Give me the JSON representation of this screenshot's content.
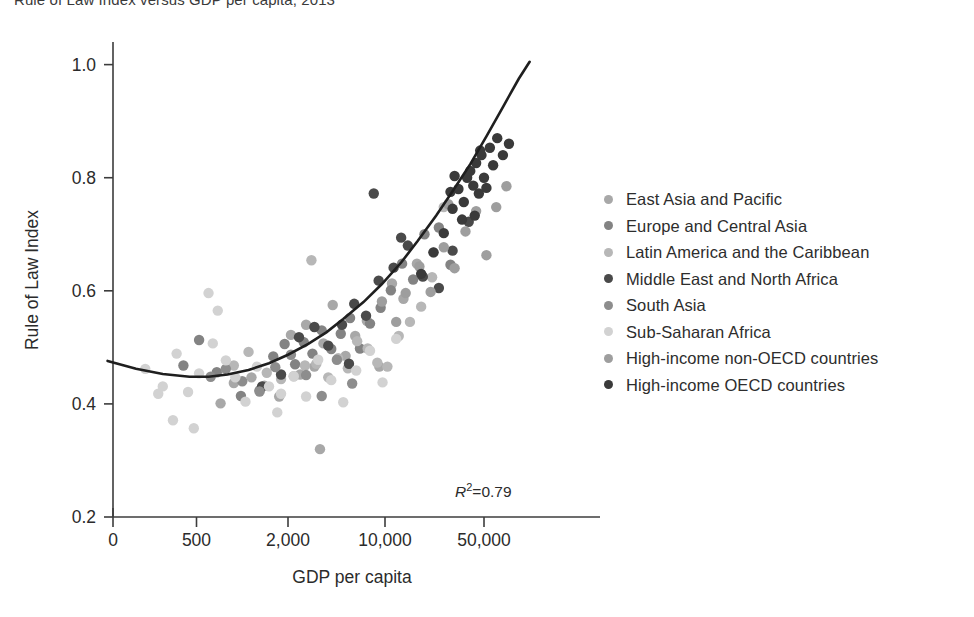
{
  "chart_data": {
    "type": "scatter",
    "title": "Rule of Law Index versus GDP per capita, 2013",
    "xlabel": "GDP per capita",
    "ylabel": "Rule of Law Index",
    "xscale": "log",
    "xticks": [
      0,
      500,
      2000,
      10000,
      50000
    ],
    "xtick_labels": [
      "0",
      "500",
      "2,000",
      "10,000",
      "50,000"
    ],
    "yticks": [
      0.2,
      0.4,
      0.6,
      0.8,
      1.0
    ],
    "ytick_labels": [
      "0.2",
      "0.4",
      "0.6",
      "0.8",
      "1.0"
    ],
    "ylim": [
      0.2,
      1.04
    ],
    "grid": false,
    "legend_position": "right",
    "annotation": "R2=0.79",
    "annotation_value": 0.79,
    "fit_curve": {
      "label": "quadratic fit",
      "color": "#1f1f1f",
      "points": [
        [
          130,
          0.476
        ],
        [
          200,
          0.462
        ],
        [
          300,
          0.453
        ],
        [
          450,
          0.448
        ],
        [
          600,
          0.448
        ],
        [
          800,
          0.452
        ],
        [
          1100,
          0.46
        ],
        [
          1500,
          0.472
        ],
        [
          2000,
          0.487
        ],
        [
          2800,
          0.506
        ],
        [
          3800,
          0.527
        ],
        [
          5000,
          0.55
        ],
        [
          7000,
          0.58
        ],
        [
          9500,
          0.612
        ],
        [
          13000,
          0.65
        ],
        [
          17000,
          0.688
        ],
        [
          23000,
          0.733
        ],
        [
          30000,
          0.776
        ],
        [
          40000,
          0.824
        ],
        [
          52000,
          0.873
        ],
        [
          68000,
          0.925
        ],
        [
          88000,
          0.975
        ],
        [
          105000,
          1.005
        ]
      ]
    },
    "series": [
      {
        "name": "East Asia and Pacific",
        "color": "#a8a8a8",
        "points": [
          [
            1150,
            0.447
          ],
          [
            1400,
            0.432
          ],
          [
            1750,
            0.413
          ],
          [
            2100,
            0.522
          ],
          [
            2450,
            0.452
          ],
          [
            2700,
            0.54
          ],
          [
            3100,
            0.466
          ],
          [
            3600,
            0.507
          ],
          [
            4200,
            0.575
          ],
          [
            5200,
            0.485
          ],
          [
            6100,
            0.52
          ],
          [
            7400,
            0.547
          ],
          [
            9100,
            0.466
          ],
          [
            11200,
            0.613
          ],
          [
            13500,
            0.586
          ],
          [
            16800,
            0.648
          ],
          [
            22000,
            0.668
          ],
          [
            720,
            0.401
          ],
          [
            880,
            0.437
          ],
          [
            3400,
            0.32
          ]
        ]
      },
      {
        "name": "Europe and Central Asia",
        "color": "#838383",
        "points": [
          [
            980,
            0.414
          ],
          [
            1300,
            0.424
          ],
          [
            1600,
            0.484
          ],
          [
            1900,
            0.506
          ],
          [
            2250,
            0.47
          ],
          [
            2600,
            0.509
          ],
          [
            3000,
            0.489
          ],
          [
            3500,
            0.53
          ],
          [
            4100,
            0.497
          ],
          [
            4800,
            0.524
          ],
          [
            5600,
            0.552
          ],
          [
            6600,
            0.498
          ],
          [
            7800,
            0.542
          ],
          [
            9300,
            0.57
          ],
          [
            11000,
            0.601
          ],
          [
            13200,
            0.648
          ],
          [
            15800,
            0.62
          ],
          [
            19000,
            0.7
          ],
          [
            24000,
            0.712
          ],
          [
            29000,
            0.646
          ],
          [
            680,
            0.456
          ],
          [
            520,
            0.513
          ],
          [
            410,
            0.468
          ]
        ]
      },
      {
        "name": "Latin America and the Caribbean",
        "color": "#b7b7b7",
        "points": [
          [
            1450,
            0.455
          ],
          [
            1800,
            0.444
          ],
          [
            2200,
            0.449
          ],
          [
            2650,
            0.468
          ],
          [
            3200,
            0.471
          ],
          [
            3900,
            0.447
          ],
          [
            4600,
            0.481
          ],
          [
            5400,
            0.463
          ],
          [
            6300,
            0.511
          ],
          [
            7500,
            0.498
          ],
          [
            8800,
            0.473
          ],
          [
            10400,
            0.466
          ],
          [
            12500,
            0.52
          ],
          [
            15000,
            0.545
          ],
          [
            18000,
            0.572
          ],
          [
            21500,
            0.624
          ],
          [
            2950,
            0.654
          ],
          [
            1100,
            0.492
          ],
          [
            880,
            0.468
          ],
          [
            26000,
            0.748
          ]
        ]
      },
      {
        "name": "Middle East and North Africa",
        "color": "#4a4a4a",
        "points": [
          [
            2400,
            0.518
          ],
          [
            3100,
            0.536
          ],
          [
            3900,
            0.503
          ],
          [
            4900,
            0.54
          ],
          [
            6000,
            0.577
          ],
          [
            7300,
            0.556
          ],
          [
            9000,
            0.618
          ],
          [
            11500,
            0.641
          ],
          [
            14500,
            0.68
          ],
          [
            18500,
            0.625
          ],
          [
            24000,
            0.605
          ],
          [
            30000,
            0.671
          ],
          [
            39000,
            0.722
          ],
          [
            1800,
            0.452
          ],
          [
            1350,
            0.431
          ],
          [
            5500,
            0.471
          ],
          [
            8300,
            0.772
          ],
          [
            13000,
            0.694
          ]
        ]
      },
      {
        "name": "South Asia",
        "color": "#8d8d8d",
        "points": [
          [
            620,
            0.448
          ],
          [
            780,
            0.462
          ],
          [
            1000,
            0.44
          ],
          [
            1300,
            0.422
          ],
          [
            1650,
            0.465
          ],
          [
            2100,
            0.487
          ],
          [
            2700,
            0.451
          ],
          [
            3500,
            0.414
          ],
          [
            4500,
            0.478
          ],
          [
            5800,
            0.436
          ]
        ]
      },
      {
        "name": "Sub-Saharan Africa",
        "color": "#d2d2d2",
        "points": [
          [
            230,
            0.462
          ],
          [
            300,
            0.431
          ],
          [
            370,
            0.489
          ],
          [
            440,
            0.421
          ],
          [
            520,
            0.454
          ],
          [
            600,
            0.596
          ],
          [
            690,
            0.565
          ],
          [
            780,
            0.477
          ],
          [
            900,
            0.447
          ],
          [
            1050,
            0.404
          ],
          [
            1250,
            0.466
          ],
          [
            1500,
            0.431
          ],
          [
            1800,
            0.418
          ],
          [
            2200,
            0.449
          ],
          [
            2700,
            0.413
          ],
          [
            3300,
            0.478
          ],
          [
            4100,
            0.442
          ],
          [
            5000,
            0.403
          ],
          [
            6200,
            0.459
          ],
          [
            7800,
            0.494
          ],
          [
            9600,
            0.438
          ],
          [
            12000,
            0.515
          ],
          [
            480,
            0.357
          ],
          [
            350,
            0.371
          ],
          [
            280,
            0.418
          ],
          [
            640,
            0.507
          ],
          [
            1700,
            0.385
          ]
        ]
      },
      {
        "name": "High-income non-OECD countries",
        "color": "#9e9e9e",
        "points": [
          [
            14000,
            0.596
          ],
          [
            17500,
            0.643
          ],
          [
            21000,
            0.598
          ],
          [
            26000,
            0.677
          ],
          [
            31000,
            0.64
          ],
          [
            37000,
            0.705
          ],
          [
            44000,
            0.741
          ],
          [
            52000,
            0.663
          ],
          [
            61000,
            0.748
          ],
          [
            72000,
            0.785
          ],
          [
            12000,
            0.545
          ],
          [
            9500,
            0.581
          ],
          [
            28000,
            0.753
          ]
        ]
      },
      {
        "name": "High-income OECD countries",
        "color": "#3a3a3a",
        "points": [
          [
            18000,
            0.63
          ],
          [
            22000,
            0.668
          ],
          [
            26000,
            0.702
          ],
          [
            30000,
            0.745
          ],
          [
            33000,
            0.78
          ],
          [
            36000,
            0.757
          ],
          [
            38000,
            0.8
          ],
          [
            40000,
            0.812
          ],
          [
            42000,
            0.786
          ],
          [
            44000,
            0.826
          ],
          [
            46000,
            0.772
          ],
          [
            48000,
            0.84
          ],
          [
            50000,
            0.8
          ],
          [
            52000,
            0.782
          ],
          [
            55000,
            0.853
          ],
          [
            58000,
            0.822
          ],
          [
            62000,
            0.87
          ],
          [
            68000,
            0.84
          ],
          [
            75000,
            0.86
          ],
          [
            35000,
            0.726
          ],
          [
            43000,
            0.733
          ],
          [
            31000,
            0.803
          ],
          [
            29000,
            0.775
          ],
          [
            47000,
            0.848
          ]
        ]
      }
    ]
  },
  "legend": {
    "items": [
      {
        "label": "East Asia and Pacific",
        "color": "#a8a8a8"
      },
      {
        "label": "Europe and Central Asia",
        "color": "#838383"
      },
      {
        "label": "Latin America and the Caribbean",
        "color": "#b7b7b7"
      },
      {
        "label": "Middle East and North Africa",
        "color": "#4a4a4a"
      },
      {
        "label": "South Asia",
        "color": "#8d8d8d"
      },
      {
        "label": "Sub-Saharan Africa",
        "color": "#d2d2d2"
      },
      {
        "label": "High-income non-OECD countries",
        "color": "#9e9e9e"
      },
      {
        "label": "High-income OECD countries",
        "color": "#3a3a3a"
      }
    ]
  },
  "annotation": {
    "r2_prefix": "R",
    "r2_sup": "2",
    "r2_value": "=0.79"
  },
  "axes": {
    "x_title": "GDP per capita",
    "y_title": "Rule of Law Index"
  },
  "colors": {
    "axis": "#3c3c3c",
    "curve": "#1f1f1f",
    "text": "#2b2b2b"
  }
}
